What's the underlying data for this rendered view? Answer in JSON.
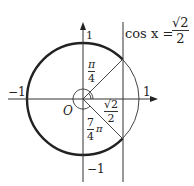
{
  "diagram": {
    "equation": {
      "lhs": "cos x =",
      "numerator": "√2",
      "denominator": "2"
    },
    "axis_labels": {
      "y_top": "1",
      "y_bottom": "−1",
      "x_left": "−1",
      "x_right": "1",
      "origin": "O"
    },
    "angle_pi_over_4": {
      "numerator": "π",
      "denominator": "4"
    },
    "angle_7_over_4_pi": {
      "numerator": "7",
      "denominator": "4",
      "suffix": "π"
    },
    "segment_label": {
      "numerator": "√2",
      "denominator": "2"
    },
    "colors": {
      "stroke": "#333333",
      "background": "#ffffff"
    }
  }
}
